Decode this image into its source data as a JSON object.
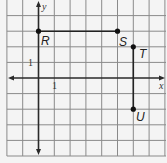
{
  "figure": {
    "axes": {
      "x_label": "x",
      "y_label": "y",
      "x_tick_label": "1",
      "y_tick_label": "1"
    },
    "grid": {
      "x_range": [
        -2,
        8
      ],
      "y_range": [
        -5,
        5
      ],
      "unit_px_x": 15.8,
      "unit_px_y": 15.6,
      "origin_px": [
        38.5,
        78
      ]
    },
    "points": [
      {
        "label": "R",
        "x": 0,
        "y": 3
      },
      {
        "label": "S",
        "x": 5,
        "y": 3
      },
      {
        "label": "T",
        "x": 6,
        "y": 2
      },
      {
        "label": "U",
        "x": 6,
        "y": -2
      }
    ],
    "segments": [
      {
        "from": "R",
        "to": "S"
      },
      {
        "from": "T",
        "to": "U"
      }
    ],
    "colors": {
      "grid": "#8a8a8a",
      "axis": "#2a2a2a",
      "background": "#f4f4f4",
      "ink": "#222222"
    }
  }
}
